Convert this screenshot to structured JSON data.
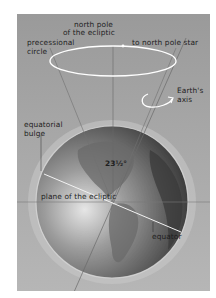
{
  "diagram": {
    "type": "astronomy-illustration",
    "labels": {
      "north_pole_ecliptic_line1": "north pole",
      "north_pole_ecliptic_line2": "of the ecliptic",
      "precessional_circle_line1": "precessional",
      "precessional_circle_line2": "circle",
      "to_north_pole_star": "to north pole star",
      "earths_axis_line1": "Earth's",
      "earths_axis_line2": "axis",
      "equatorial_bulge_line1": "equatorial",
      "equatorial_bulge_line2": "bulge",
      "tilt_angle": "23½°",
      "plane_of_ecliptic": "plane of the ecliptic",
      "equator": "equator"
    },
    "colors": {
      "background_panel": "#a3a3a3",
      "ocean_light": "#d4d4d4",
      "ocean_dark": "#3a3a3a",
      "circle_stroke": "#ffffff",
      "guide_lines": "#6e6e6e"
    }
  }
}
